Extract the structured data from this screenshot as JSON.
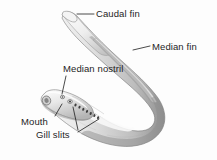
{
  "figure": {
    "background_color": "#fdfdfd",
    "line_color": "#1d1d1d",
    "body_light": "#f2f2f2",
    "body_mid": "#cfcfcf",
    "body_dark": "#8d8d8d",
    "body_shadow": "#5e5e5e"
  },
  "labels": {
    "caudal_fin": "Caudal fin",
    "median_fin": "Median fin",
    "median_nostril": "Median nostril",
    "mouth": "Mouth",
    "gill_slits": "Gill slits"
  },
  "anatomy": {
    "gill_slit_count": 7,
    "eye_count": 1,
    "nostril_count": 1
  }
}
